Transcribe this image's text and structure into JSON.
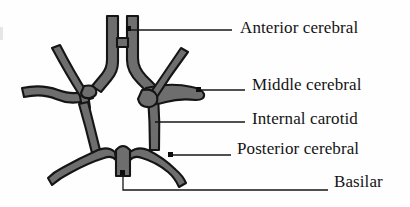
{
  "figure": {
    "background_color": "#fefefe",
    "vessel_fill_color": "#6e6e6e",
    "vessel_outline_color": "#151515",
    "leader_line_color": "#161616",
    "text_color": "#141414"
  },
  "labels": {
    "anterior_cerebral": "Anterior cerebral",
    "middle_cerebral": "Middle cerebral",
    "internal_carotid": "Internal carotid",
    "posterior_cerebral": "Posterior cerebral",
    "basilar": "Basilar"
  },
  "leader_lines": [
    {
      "name": "anterior-cerebral-leader",
      "from_x": 130,
      "from_y": 30,
      "to_x": 232,
      "to_y": 30,
      "dot": true
    },
    {
      "name": "middle-cerebral-leader",
      "from_x": 200,
      "from_y": 90,
      "to_x": 245,
      "to_y": 90,
      "dot": true
    },
    {
      "name": "internal-carotid-leader",
      "from_x": 155,
      "from_y": 122,
      "to_x": 245,
      "to_y": 122,
      "dot": false
    },
    {
      "name": "posterior-cerebral-leader",
      "from_x": 172,
      "from_y": 155,
      "to_x": 231,
      "to_y": 155,
      "dot": true
    },
    {
      "name": "basilar-leader",
      "from_x": 123,
      "from_y": 175,
      "to_x": 328,
      "to_y": 190,
      "dot": true
    }
  ],
  "vessels": [
    {
      "name": "anterior-cerebral-left",
      "description": "Left anterior cerebral artery ascending limb"
    },
    {
      "name": "anterior-cerebral-right",
      "description": "Right anterior cerebral artery ascending limb"
    },
    {
      "name": "anterior-communicating",
      "description": "Anterior communicating artery crossbar"
    },
    {
      "name": "middle-cerebral-left",
      "description": "Left middle cerebral artery"
    },
    {
      "name": "middle-cerebral-right",
      "description": "Right middle cerebral artery"
    },
    {
      "name": "internal-carotid-left",
      "description": "Left internal carotid artery"
    },
    {
      "name": "internal-carotid-right",
      "description": "Right internal carotid artery"
    },
    {
      "name": "posterior-communicating-left",
      "description": "Left posterior communicating artery"
    },
    {
      "name": "posterior-communicating-right",
      "description": "Right posterior communicating artery"
    },
    {
      "name": "posterior-cerebral-left",
      "description": "Left posterior cerebral artery"
    },
    {
      "name": "posterior-cerebral-right",
      "description": "Right posterior cerebral artery"
    },
    {
      "name": "basilar-artery",
      "description": "Basilar artery stub at base"
    }
  ]
}
